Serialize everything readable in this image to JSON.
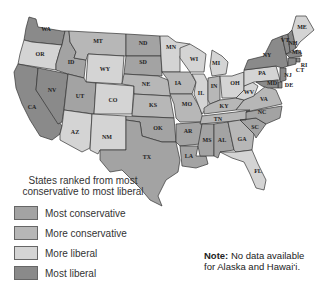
{
  "legend": {
    "title_line1": "States ranked from most",
    "title_line2": "conservative to most liberal",
    "items": [
      {
        "label": "Most conservative",
        "color": "#a3a3a3"
      },
      {
        "label": "More conservative",
        "color": "#b7b7b7"
      },
      {
        "label": "More liberal",
        "color": "#d4d4d4"
      },
      {
        "label": "Most liberal",
        "color": "#8a8a8a"
      }
    ]
  },
  "note": {
    "bold": "Note:",
    "line1": " No data available",
    "line2": "for Alaska and Hawai‘i."
  },
  "states": {
    "WA": "Most liberal",
    "OR": "More liberal",
    "CA": "Most liberal",
    "NV": "Most liberal",
    "ID": "Most conservative",
    "MT": "More conservative",
    "WY": "More liberal",
    "UT": "Most conservative",
    "AZ": "More liberal",
    "CO": "More liberal",
    "NM": "More liberal",
    "ND": "Most conservative",
    "SD": "Most conservative",
    "NE": "More conservative",
    "KS": "More conservative",
    "OK": "Most conservative",
    "TX": "Most conservative",
    "MN": "More liberal",
    "IA": "More conservative",
    "MO": "More conservative",
    "AR": "Most conservative",
    "LA": "Most conservative",
    "WI": "More liberal",
    "IL": "More liberal",
    "MI": "More liberal",
    "IN": "More conservative",
    "OH": "More liberal",
    "KY": "More conservative",
    "TN": "More conservative",
    "MS": "Most conservative",
    "AL": "Most conservative",
    "GA": "More conservative",
    "FL": "More liberal",
    "SC": "Most conservative",
    "NC": "Most conservative",
    "VA": "More conservative",
    "WV": "More liberal",
    "PA": "More liberal",
    "NY": "Most liberal",
    "VT": "Most liberal",
    "NH": "Most liberal",
    "ME": "More liberal",
    "MA": "Most liberal",
    "RI": "Most liberal",
    "CT": "Most liberal",
    "NJ": "Most liberal",
    "DE": "Most liberal",
    "MD": "Most liberal"
  },
  "labels": {
    "WA": "WA",
    "OR": "OR",
    "CA": "CA",
    "NV": "NV",
    "ID": "ID",
    "MT": "MT",
    "WY": "WY",
    "UT": "UT",
    "AZ": "AZ",
    "CO": "CO",
    "NM": "NM",
    "ND": "ND",
    "SD": "SD",
    "NE": "NE",
    "KS": "KS",
    "OK": "OK",
    "TX": "TX",
    "MN": "MN",
    "IA": "IA",
    "MO": "MO",
    "AR": "AR",
    "LA": "LA",
    "WI": "WI",
    "IL": "IL",
    "MI": "MI",
    "IN": "IN",
    "OH": "OH",
    "KY": "KY",
    "TN": "TN",
    "MS": "MS",
    "AL": "AL",
    "GA": "GA",
    "FL": "FL",
    "SC": "SC",
    "NC": "NC",
    "VA": "VA",
    "WV": "WV",
    "PA": "PA",
    "NY": "NY",
    "VT": "VT",
    "NH": "NH",
    "ME": "ME",
    "MA": "MA",
    "RI": "RI",
    "CT": "CT",
    "NJ": "NJ",
    "DE": "DE",
    "MD": "MD"
  }
}
